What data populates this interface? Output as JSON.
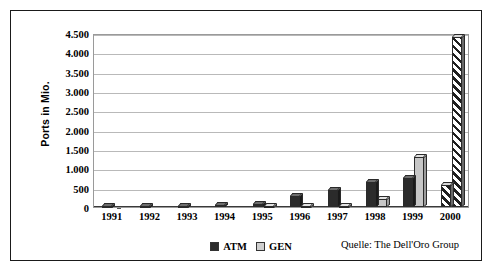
{
  "figure": {
    "ylabel": "Ports in Mio.",
    "source_note": "Quelle: The Dell'Oro Group"
  },
  "legend": {
    "items": [
      {
        "label": "ATM",
        "swatch": "dark-square-icon",
        "color": "#2b2b2b"
      },
      {
        "label": "GEN",
        "swatch": "light-square-icon",
        "color": "#cfcfcf"
      }
    ]
  },
  "chart_data": {
    "type": "bar",
    "title": "",
    "subtitle": "",
    "xlabel": "",
    "ylabel": "Ports in Mio.",
    "ylim": [
      0,
      4500
    ],
    "yticks": [
      0,
      500,
      1000,
      1500,
      2000,
      2500,
      3000,
      3500,
      4000,
      4500
    ],
    "ytick_labels": [
      "0",
      "500",
      "1.000",
      "1.500",
      "2.000",
      "2.500",
      "3.000",
      "3.500",
      "4.000",
      "4.500"
    ],
    "categories": [
      "1991",
      "1992",
      "1993",
      "1994",
      "1995",
      "1996",
      "1997",
      "1998",
      "1999",
      "2000"
    ],
    "grid": true,
    "legend_position": "bottom-center",
    "annotations": [
      "Quelle: The Dell'Oro Group"
    ],
    "series": [
      {
        "name": "ATM",
        "color": "#2b2b2b",
        "values": [
          25,
          30,
          35,
          45,
          70,
          290,
          450,
          650,
          760,
          560
        ],
        "hatched_indices": [
          9
        ]
      },
      {
        "name": "GEN",
        "color": "#c6c6c6",
        "values": [
          0,
          0,
          0,
          0,
          10,
          20,
          30,
          200,
          1300,
          4400
        ],
        "hatched_indices": [
          9
        ]
      }
    ]
  }
}
